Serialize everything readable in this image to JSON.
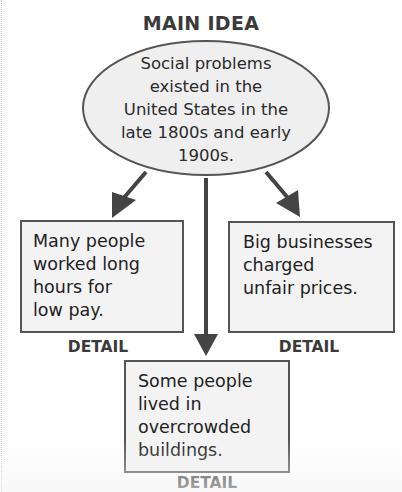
{
  "diagram": {
    "type": "main-idea-detail-organizer",
    "main_idea": {
      "title": "MAIN IDEA",
      "text_lines": [
        "Social problems",
        "existed in the",
        "United States in the",
        "late 1800s and early",
        "1900s."
      ]
    },
    "details": [
      {
        "position": "left",
        "label": "DETAIL",
        "text_lines": [
          "Many people",
          "worked long",
          "hours for",
          "low pay."
        ]
      },
      {
        "position": "right",
        "label": "DETAIL",
        "text_lines": [
          "Big businesses",
          "charged",
          "unfair prices."
        ]
      },
      {
        "position": "bottom",
        "label": "DETAIL",
        "text_lines": [
          "Some people",
          "lived in",
          "overcrowded",
          "buildings."
        ]
      }
    ],
    "colors": {
      "stroke": "#555555",
      "ellipse_fill": "#efefef",
      "box_fill": "#f3f3f3",
      "arrow": "#444444",
      "text": "#2a2a2a"
    }
  }
}
